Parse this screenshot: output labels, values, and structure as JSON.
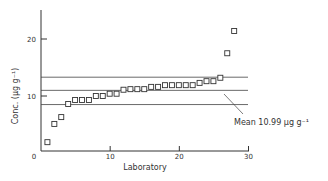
{
  "chart_data": {
    "type": "scatter",
    "title": "",
    "xlabel": "Laboratory",
    "ylabel": "Conc. (µg g⁻¹)",
    "xlim": [
      0,
      30
    ],
    "ylim": [
      0,
      25
    ],
    "x_ticks": [
      0,
      10,
      20,
      30
    ],
    "y_ticks": [
      0,
      10,
      20
    ],
    "x_tick_labels": [
      "0",
      "10",
      "20",
      "30"
    ],
    "y_tick_labels": [
      "0",
      "10",
      "20"
    ],
    "grid": false,
    "marker": "open-square",
    "x": [
      1,
      2,
      3,
      4,
      5,
      6,
      7,
      8,
      9,
      10,
      11,
      12,
      13,
      14,
      15,
      16,
      17,
      18,
      19,
      20,
      21,
      22,
      23,
      24,
      25,
      26,
      27,
      28
    ],
    "values": [
      1.9,
      5.1,
      6.3,
      8.6,
      9.3,
      9.3,
      9.3,
      10.0,
      10.0,
      10.4,
      10.4,
      11.1,
      11.2,
      11.2,
      11.2,
      11.6,
      11.6,
      11.9,
      11.9,
      11.9,
      11.9,
      11.9,
      12.3,
      12.6,
      12.6,
      13.2,
      17.5,
      21.4
    ],
    "reference_lines": [
      {
        "name": "upper",
        "y": 13.3
      },
      {
        "name": "mean",
        "y": 10.99
      },
      {
        "name": "lower",
        "y": 8.5
      }
    ],
    "annotation": "Mean 10.99 µg g⁻¹"
  },
  "labels": {
    "xlabel": "Laboratory",
    "ylabel": "Conc. (µg g⁻¹)",
    "annotation": "Mean 10.99 µg g⁻¹",
    "x_ticks": [
      "0",
      "10",
      "20",
      "30"
    ],
    "y_ticks": [
      "10",
      "20"
    ]
  }
}
